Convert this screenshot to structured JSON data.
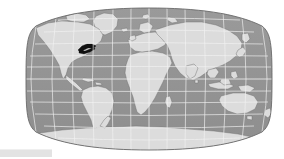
{
  "figure": {
    "kind": "world-locator-map",
    "projection": "Robinson",
    "canvas": {
      "width": 284,
      "height": 159
    }
  },
  "colors": {
    "background": "#ffffff",
    "ocean": "#949494",
    "ocean_shade": "#8d8d8d",
    "land": "#dcdcdc",
    "land_edge": "#6f6f6f",
    "coast_line": "#777777",
    "graticule": "#f2f2f2",
    "highlight": "#111111",
    "map_outline": "#6a6a6a",
    "status_sliver": "#e3e3e3"
  },
  "graticule": {
    "visible": true,
    "parallels_deg": [
      75,
      60,
      45,
      30,
      15,
      0,
      -15,
      -30,
      -45,
      -60,
      -75
    ],
    "meridians_deg": [
      -180,
      -150,
      -120,
      -90,
      -60,
      -30,
      0,
      30,
      60,
      90,
      120,
      150,
      180
    ],
    "equator_deg": 0,
    "spacing_deg": 30,
    "stroke_width": 0.7
  },
  "highlight": {
    "visible": true,
    "fill": "#111111",
    "shape": "crescent-wedge",
    "approx_center_px": {
      "x": 86,
      "y": 49
    },
    "approx_bbox_px": {
      "x": 78,
      "y": 44,
      "width": 18,
      "height": 10
    },
    "region_hint": "great-lakes-northeast-north-america"
  },
  "landmasses": [
    {
      "name": "north-america"
    },
    {
      "name": "greenland"
    },
    {
      "name": "south-america"
    },
    {
      "name": "africa"
    },
    {
      "name": "europe"
    },
    {
      "name": "asia"
    },
    {
      "name": "australia"
    },
    {
      "name": "antarctica"
    },
    {
      "name": "madagascar"
    },
    {
      "name": "new-zealand"
    },
    {
      "name": "indonesia-archipelago"
    },
    {
      "name": "japan"
    },
    {
      "name": "british-isles"
    },
    {
      "name": "arctic-islands"
    }
  ],
  "map_bounds_px": {
    "left": 28,
    "right": 270,
    "top": 8,
    "bottom": 150,
    "center_x": 149,
    "center_y": 79
  },
  "status_sliver": {
    "visible": true,
    "label": ""
  }
}
